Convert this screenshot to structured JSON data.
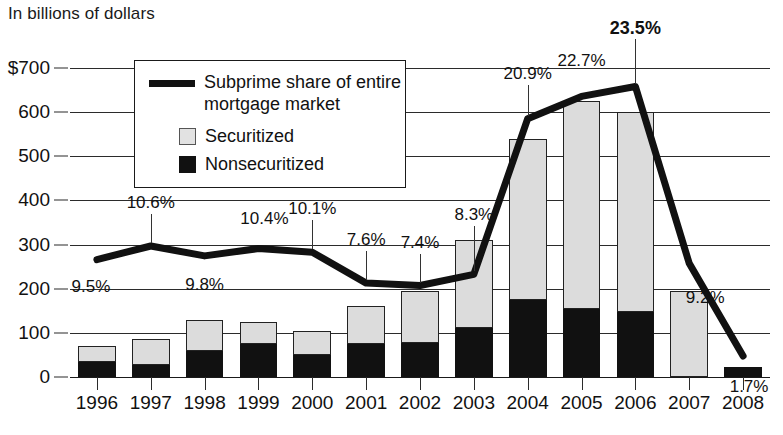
{
  "chart_data": {
    "type": "bar",
    "title": "In billions of dollars",
    "subtitle": "",
    "xlabel": "",
    "ylabel": "In billions of dollars",
    "ylim": [
      0,
      700
    ],
    "yticks": [
      "$700",
      "600",
      "500",
      "400",
      "300",
      "200",
      "100",
      "0"
    ],
    "ytick_values": [
      700,
      600,
      500,
      400,
      300,
      200,
      100,
      0
    ],
    "grid": true,
    "legend_position": "upper-left-inset",
    "categories": [
      "1996",
      "1997",
      "1998",
      "1999",
      "2000",
      "2001",
      "2002",
      "2003",
      "2004",
      "2005",
      "2006",
      "2007",
      "2008"
    ],
    "series": [
      {
        "name": "Nonsecuritized",
        "type": "bar-stacked",
        "color": "#111111",
        "values": [
          35,
          28,
          60,
          75,
          50,
          75,
          78,
          110,
          175,
          155,
          148,
          0,
          22
        ]
      },
      {
        "name": "Securitized",
        "type": "bar-stacked",
        "color": "#dcdcdc",
        "values": [
          35,
          57,
          70,
          50,
          55,
          85,
          117,
          200,
          365,
          470,
          452,
          195,
          0
        ]
      },
      {
        "name": "Subprime share of entire mortgage market",
        "type": "line",
        "color": "#111111",
        "unit": "%",
        "values": [
          9.5,
          10.6,
          9.8,
          10.4,
          10.1,
          7.6,
          7.4,
          8.3,
          20.9,
          22.7,
          23.5,
          9.2,
          1.7
        ],
        "labels": [
          "9.5%",
          "10.6%",
          "9.8%",
          "10.4%",
          "10.1%",
          "7.6%",
          "7.4%",
          "8.3%",
          "20.9%",
          "22.7%",
          "23.5%",
          "9.2%",
          "1.7%"
        ]
      }
    ],
    "bar_totals": [
      70,
      85,
      130,
      125,
      105,
      160,
      195,
      310,
      540,
      625,
      600,
      195,
      22
    ],
    "annotations": {
      "highlighted_label": "23.5%",
      "highlighted_year": "2006"
    }
  },
  "legend": {
    "line_label_line1": "Subprime share of entire",
    "line_label_line2": "mortgage market",
    "securitized_label": "Securitized",
    "nonsecuritized_label": "Nonsecuritized"
  },
  "colors": {
    "securitized": "#dcdcdc",
    "nonsecuritized": "#111111",
    "line": "#111111",
    "axis": "#2b2b2b",
    "background": "#ffffff"
  }
}
